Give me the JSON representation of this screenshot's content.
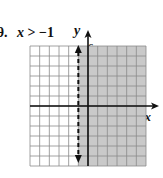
{
  "problem": {
    "number": "9.",
    "inequality_var": "x",
    "inequality_rest": " > −1",
    "boundary_x": -1,
    "boundary_style": "dashed",
    "shaded_side": "right"
  },
  "graph": {
    "x_axis_label": "x",
    "y_axis_label": "y",
    "x_tick_label": "6",
    "y_tick_label": "6",
    "x_range": [
      -6,
      6
    ],
    "y_range": [
      -6,
      6
    ],
    "grid_step": 1,
    "colors": {
      "shade": "#c9c9c9",
      "grid_line": "#8a8a8a",
      "axis": "#111111",
      "boundary": "#111111"
    }
  }
}
